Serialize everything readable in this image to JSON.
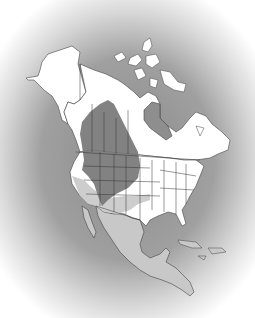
{
  "map": {
    "title": "",
    "region": "North America",
    "legend": [],
    "colors": {
      "background_center": "#8a8a8a",
      "background_edge": "#ffffff",
      "land": "#ffffff",
      "breeding_range": "#777777",
      "winter_range": "#c8c8c8",
      "water": "#8e8e8e",
      "borders": "#333333"
    }
  }
}
